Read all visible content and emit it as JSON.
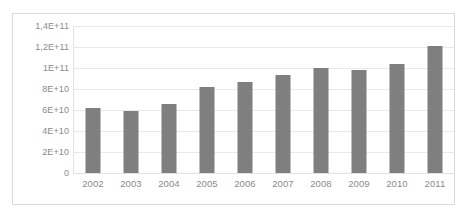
{
  "chart_data": {
    "type": "bar",
    "title": "",
    "subtitle": "",
    "xlabel": "",
    "ylabel": "",
    "categories": [
      "2002",
      "2003",
      "2004",
      "2005",
      "2006",
      "2007",
      "2008",
      "2009",
      "2010",
      "2011"
    ],
    "values": [
      62000000000,
      59000000000,
      66000000000,
      82000000000,
      87000000000,
      93000000000,
      100000000000,
      98000000000,
      104000000000,
      121000000000
    ],
    "series": [
      {
        "name": "",
        "values": [
          62000000000,
          59000000000,
          66000000000,
          82000000000,
          87000000000,
          93000000000,
          100000000000,
          98000000000,
          104000000000,
          121000000000
        ]
      }
    ],
    "ylim": [
      0,
      140000000000
    ],
    "ytick_values": [
      140000000000,
      120000000000,
      100000000000,
      80000000000,
      60000000000,
      40000000000,
      20000000000,
      0
    ],
    "ytick_labels": [
      "1,4E+11",
      "1,2E+11",
      "1E+11",
      "8E+10",
      "6E+10",
      "4E+10",
      "2E+10",
      "0"
    ],
    "xtick_labels": [
      "2002",
      "2003",
      "2004",
      "2005",
      "2006",
      "2007",
      "2008",
      "2009",
      "2010",
      "2011"
    ],
    "grid": true,
    "grid_axis": "y",
    "legend": false,
    "legend_position": "none",
    "annotations": [],
    "colors": {
      "bar": "#7f7f7f",
      "gridline": "#e9e9e9",
      "axis": "#e2e2e2",
      "tick_text": "#8a8a8a",
      "plot_background": "#ffffff",
      "figure_border": "#d9d9d9",
      "page_background": "#ffffff"
    }
  }
}
